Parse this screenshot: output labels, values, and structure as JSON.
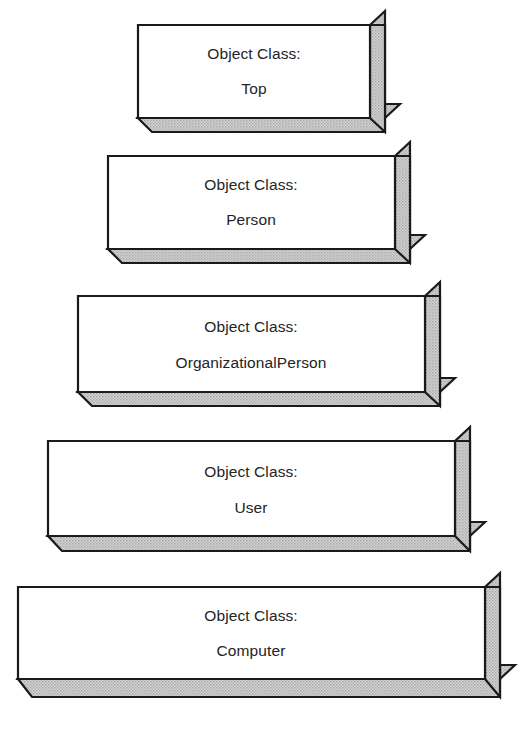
{
  "diagram": {
    "type": "layered-3d-blocks",
    "label_prefix": "Object Class:",
    "colors": {
      "face": "#ffffff",
      "shade": "#c8c8c8",
      "outline": "#1a1a1a",
      "text": "#242424",
      "background": "#ffffff"
    },
    "blocks": [
      {
        "id": "block-top",
        "name": "top",
        "line1": "Object Class:",
        "line2": "Top",
        "level": 1
      },
      {
        "id": "block-person",
        "name": "person",
        "line1": "Object Class:",
        "line2": "Person",
        "level": 2
      },
      {
        "id": "block-organizationalperson",
        "name": "organizationalPerson",
        "line1": "Object Class:",
        "line2": "OrganizationalPerson",
        "level": 3
      },
      {
        "id": "block-user",
        "name": "user",
        "line1": "Object Class:",
        "line2": "User",
        "level": 4
      },
      {
        "id": "block-computer",
        "name": "computer",
        "line1": "Object Class:",
        "line2": "Computer",
        "level": 5
      }
    ]
  }
}
